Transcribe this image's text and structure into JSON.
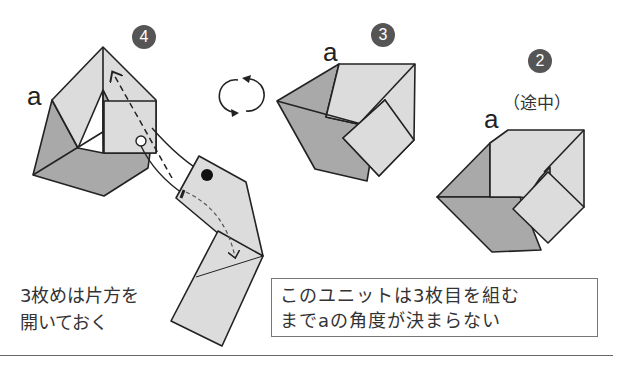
{
  "steps": [
    {
      "number": "4",
      "label": "a"
    },
    {
      "number": "3",
      "label": "a"
    },
    {
      "number": "2",
      "label": "a",
      "note": "（途中）"
    }
  ],
  "rotate_icon": "rotate-arrows-icon",
  "notes": {
    "left_line1": "3枚めは片方を",
    "left_line2": "開いておく",
    "box_line1": "このユニットは3枚目を組む",
    "box_line2": "までaの角度が決まらない"
  },
  "colors": {
    "light_paper": "#dcdcdc",
    "dark_paper": "#a9a9a9",
    "outline": "#222222",
    "badge": "#555555"
  }
}
